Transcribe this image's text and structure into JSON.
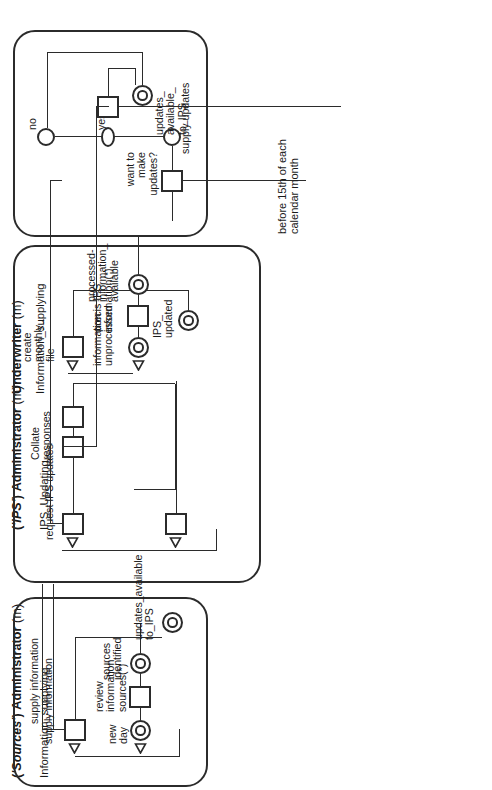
{
  "diagram": {
    "type": "role-activity-diagram",
    "orientation": "rotated-90-ccw",
    "ink_color": "#2b2b2b",
    "background": "#ffffff",
    "note": "before 15th of each\ncalendar month"
  },
  "lanes": [
    {
      "id": "underwriter",
      "role_name": "Underwriter",
      "role_suffix": "(m)",
      "state_label": "Information_supplying",
      "activities": [
        {
          "id": "uw-want",
          "label": "want to\nmake\nupdates?"
        },
        {
          "id": "uw-supply",
          "label": "supply updates"
        }
      ],
      "decisions": [
        {
          "id": "uw-yes",
          "label": "yes"
        },
        {
          "id": "uw-no",
          "label": "no"
        }
      ],
      "states": [
        {
          "id": "uw-updates-avail",
          "label": "updates_\navailable_\nto_IPS"
        }
      ]
    },
    {
      "id": "ips-admin",
      "role_name": "('IPS') Administrator",
      "role_quoted": "'IPS'",
      "role_prefix": "(",
      "role_mid": ") Administrator",
      "role_suffix": "(m)",
      "state_label": "IPS_Updating",
      "activities": [
        {
          "id": "ips-request",
          "label": "request IPS updates"
        },
        {
          "id": "ips-collate",
          "label": "Collate\nresponses"
        },
        {
          "id": "ips-create",
          "label": "create\nmonthly_\nfile"
        },
        {
          "id": "ips-precis",
          "label": "precis IPS\ninformation(*)"
        }
      ],
      "states": [
        {
          "id": "ips-info-unproc",
          "label": "information\nunprocessed"
        },
        {
          "id": "ips-proc-avail",
          "label": "processed-\ninformation_\navailable"
        },
        {
          "id": "ips-updated",
          "label": "IPS_\nupdated"
        }
      ]
    },
    {
      "id": "sources-admin",
      "role_name": "('Sources') Administrator",
      "role_quoted": "'Sources'",
      "role_prefix": "(",
      "role_mid": ") Administrator",
      "role_suffix": "(m)",
      "state_label": "Information_supplying",
      "activities": [
        {
          "id": "src-supply",
          "label": "supply information"
        },
        {
          "id": "src-review",
          "label": "review\ninformation\nsources(*)"
        }
      ],
      "states": [
        {
          "id": "src-new-day",
          "label": "new\nday"
        },
        {
          "id": "src-sources-id",
          "label": "sources\nidentified"
        },
        {
          "id": "src-updates-avail",
          "label": "updates_available\nto_IPS"
        }
      ]
    }
  ],
  "interactions": [
    {
      "id": "flow-request-to-underwriter",
      "from": "ips-request",
      "to": "uw-want"
    },
    {
      "id": "flow-supply-updates-to-collate",
      "from": "uw-supply",
      "to": "ips-collate"
    },
    {
      "id": "flow-supply-information",
      "label": "supply information",
      "from": "src-supply",
      "to": "ips-updating"
    }
  ]
}
